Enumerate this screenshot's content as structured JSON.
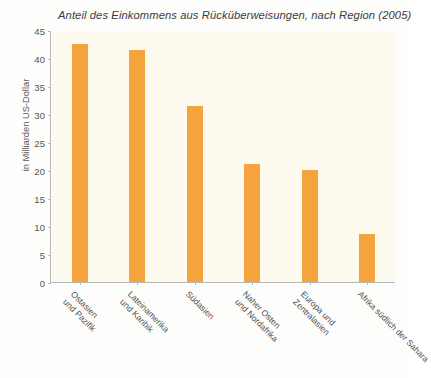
{
  "chart_data": {
    "type": "bar",
    "title": "Anteil des Einkommens aus Rücküberweisungen, nach Region (2005)",
    "xlabel": "",
    "ylabel": "in Milliarden US-Dollar",
    "categories": [
      "Ostasien\nund Pazifik",
      "Lateinamerika\nund Karibik",
      "Südasien",
      "Naher Osten\nund Nordafrika",
      "Europa und\nZentralasien",
      "Afrika südlich der Sahara"
    ],
    "category_lines": [
      [
        "Ostasien",
        "und Pazifik"
      ],
      [
        "Lateinamerika",
        "und Karibik"
      ],
      [
        "Südasien"
      ],
      [
        "Naher Osten",
        "und Nordafrika"
      ],
      [
        "Europa und",
        "Zentralasien"
      ],
      [
        "Afrika südlich der Sahara"
      ]
    ],
    "values": [
      42.5,
      41.5,
      31.5,
      21.0,
      20.0,
      8.5
    ],
    "ylim": [
      0,
      45
    ],
    "yticks": [
      0,
      5,
      10,
      15,
      20,
      25,
      30,
      35,
      40,
      45
    ],
    "ytick_labels": [
      "0",
      "5",
      "10",
      "15",
      "20",
      "25",
      "30",
      "35",
      "40",
      "45"
    ],
    "grid": false,
    "legend": null,
    "bar_color": "#f5a33c",
    "plot_background": "#fdfbef",
    "axis_color": "#b9b9b9"
  }
}
